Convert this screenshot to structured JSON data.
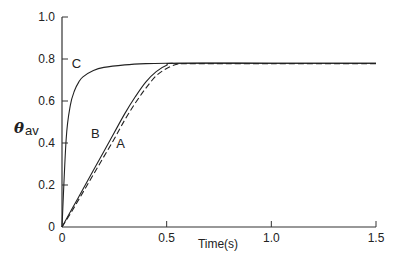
{
  "chart_data": {
    "type": "line",
    "title": "",
    "xlabel": "Time(s)",
    "ylabel": "θav",
    "ylabel_symbol": "θ",
    "ylabel_subscript": "av",
    "xlim": [
      0,
      1.5
    ],
    "ylim": [
      0,
      1.0
    ],
    "grid": false,
    "x_ticks": [
      0,
      0.5,
      1.0,
      1.5
    ],
    "x_tick_labels": [
      "0",
      "0.5",
      "1.0",
      "1.5"
    ],
    "y_ticks": [
      0,
      0.2,
      0.4,
      0.6,
      0.8,
      1.0
    ],
    "y_tick_labels": [
      "0",
      "0.2",
      "0.4",
      "0.6",
      "0.8",
      "1.0"
    ],
    "series": [
      {
        "name": "C",
        "style": "solid",
        "x": [
          0,
          0.02,
          0.04,
          0.06,
          0.08,
          0.1,
          0.15,
          0.2,
          0.3,
          0.4,
          0.5,
          0.6,
          1.0,
          1.5
        ],
        "y": [
          0,
          0.42,
          0.58,
          0.65,
          0.69,
          0.715,
          0.745,
          0.76,
          0.772,
          0.778,
          0.78,
          0.78,
          0.78,
          0.78
        ]
      },
      {
        "name": "B",
        "style": "solid",
        "x": [
          0,
          0.05,
          0.1,
          0.15,
          0.2,
          0.25,
          0.3,
          0.35,
          0.4,
          0.45,
          0.5,
          0.55,
          1.0,
          1.5
        ],
        "y": [
          0,
          0.09,
          0.18,
          0.27,
          0.36,
          0.45,
          0.54,
          0.62,
          0.69,
          0.74,
          0.77,
          0.78,
          0.78,
          0.78
        ]
      },
      {
        "name": "A",
        "style": "dashed",
        "x": [
          0,
          0.05,
          0.1,
          0.15,
          0.2,
          0.25,
          0.3,
          0.35,
          0.4,
          0.45,
          0.5,
          0.55,
          0.6,
          1.0,
          1.5
        ],
        "y": [
          0,
          0.08,
          0.165,
          0.25,
          0.335,
          0.42,
          0.51,
          0.59,
          0.66,
          0.72,
          0.755,
          0.775,
          0.778,
          0.778,
          0.778
        ]
      }
    ],
    "annotations": [
      {
        "text": "C",
        "x": 0.06,
        "y": 0.78
      },
      {
        "text": "B",
        "x": 0.15,
        "y": 0.45
      },
      {
        "text": "A",
        "x": 0.27,
        "y": 0.4
      }
    ]
  }
}
